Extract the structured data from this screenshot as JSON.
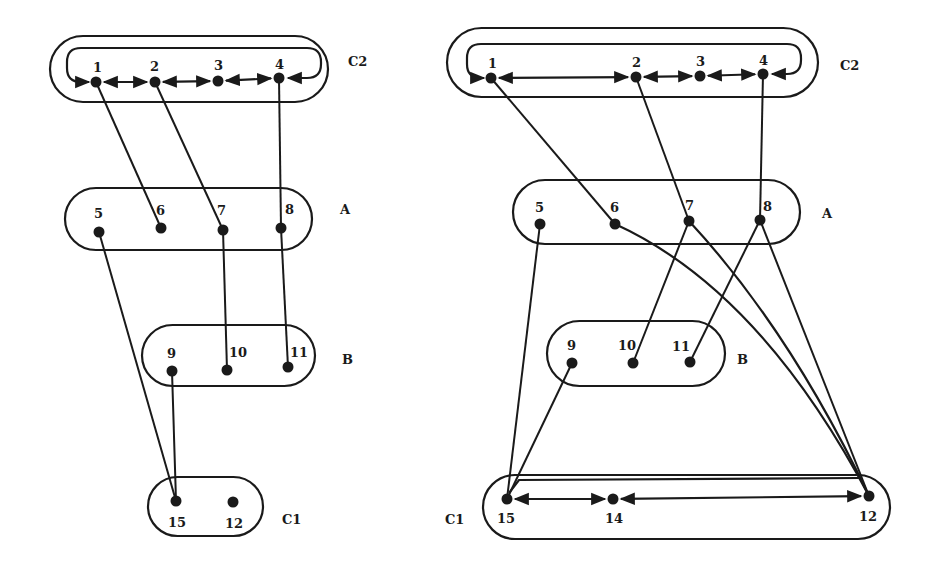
{
  "colors": {
    "ink": "#1a1a1a",
    "background": "#ffffff"
  },
  "diagrams": [
    {
      "name": "left",
      "groups": [
        {
          "id": "C2",
          "label": "C2",
          "box": [
            50,
            36,
            328,
            102
          ],
          "label_pos": [
            348,
            66
          ]
        },
        {
          "id": "A",
          "label": "A",
          "box": [
            65,
            188,
            312,
            250
          ],
          "label_pos": [
            340,
            214
          ]
        },
        {
          "id": "B",
          "label": "B",
          "box": [
            142,
            325,
            315,
            386
          ],
          "label_pos": [
            342,
            364
          ]
        },
        {
          "id": "C1",
          "label": "C1",
          "box": [
            148,
            477,
            263,
            536
          ],
          "label_pos": [
            282,
            524
          ]
        }
      ],
      "nodes": [
        {
          "id": "1",
          "label": "1",
          "x": 96,
          "y": 82,
          "label_dx": -3,
          "label_dy": -10
        },
        {
          "id": "2",
          "label": "2",
          "x": 155,
          "y": 82,
          "label_dx": -5,
          "label_dy": -11
        },
        {
          "id": "3",
          "label": "3",
          "x": 218,
          "y": 81,
          "label_dx": -4,
          "label_dy": -11
        },
        {
          "id": "4",
          "label": "4",
          "x": 279,
          "y": 78,
          "label_dx": -4,
          "label_dy": -9
        },
        {
          "id": "5",
          "label": "5",
          "x": 99,
          "y": 232,
          "label_dx": -5,
          "label_dy": -14
        },
        {
          "id": "6",
          "label": "6",
          "x": 161,
          "y": 228,
          "label_dx": -5,
          "label_dy": -13
        },
        {
          "id": "7",
          "label": "7",
          "x": 223,
          "y": 230,
          "label_dx": -6,
          "label_dy": -15
        },
        {
          "id": "8",
          "label": "8",
          "x": 281,
          "y": 228,
          "label_dx": 4,
          "label_dy": -14
        },
        {
          "id": "9",
          "label": "9",
          "x": 172,
          "y": 371,
          "label_dx": -5,
          "label_dy": -13
        },
        {
          "id": "10",
          "label": "10",
          "x": 227,
          "y": 370,
          "label_dx": 2,
          "label_dy": -13
        },
        {
          "id": "11",
          "label": "11",
          "x": 288,
          "y": 367,
          "label_dx": 2,
          "label_dy": -10
        },
        {
          "id": "15",
          "label": "15",
          "x": 176,
          "y": 501,
          "label_dx": -8,
          "label_dy": 26
        },
        {
          "id": "12",
          "label": "12",
          "x": 233,
          "y": 502,
          "label_dx": -8,
          "label_dy": 26
        }
      ],
      "edges": [
        {
          "from": "1",
          "to": "6"
        },
        {
          "from": "2",
          "to": "7"
        },
        {
          "from": "4",
          "to": "8"
        },
        {
          "from": "7",
          "to": "10"
        },
        {
          "from": "8",
          "to": "11"
        },
        {
          "from": "5",
          "to": "15"
        },
        {
          "from": "9",
          "to": "15"
        }
      ],
      "bidirectional": [
        {
          "from": "1",
          "to": "2"
        },
        {
          "from": "2",
          "to": "3"
        },
        {
          "from": "3",
          "to": "4"
        }
      ],
      "loop": {
        "from": "4",
        "to": "1",
        "top_y": 48,
        "left_x": 67,
        "right_x": 311
      }
    },
    {
      "name": "right",
      "groups": [
        {
          "id": "C2",
          "label": "C2",
          "box": [
            447,
            28,
            818,
            97
          ],
          "label_pos": [
            840,
            70
          ]
        },
        {
          "id": "A",
          "label": "A",
          "box": [
            513,
            180,
            800,
            244
          ],
          "label_pos": [
            822,
            218
          ]
        },
        {
          "id": "B",
          "label": "B",
          "box": [
            547,
            321,
            725,
            386
          ],
          "label_pos": [
            737,
            364
          ]
        },
        {
          "id": "C1",
          "label": "C1",
          "box": [
            483,
            475,
            890,
            539
          ],
          "label_pos": [
            445,
            524
          ]
        }
      ],
      "nodes": [
        {
          "id": "1",
          "label": "1",
          "x": 491,
          "y": 78,
          "label_dx": -3,
          "label_dy": -10
        },
        {
          "id": "2",
          "label": "2",
          "x": 636,
          "y": 77,
          "label_dx": -4,
          "label_dy": -10
        },
        {
          "id": "3",
          "label": "3",
          "x": 700,
          "y": 76,
          "label_dx": -4,
          "label_dy": -10
        },
        {
          "id": "4",
          "label": "4",
          "x": 763,
          "y": 74,
          "label_dx": -4,
          "label_dy": -9
        },
        {
          "id": "5",
          "label": "5",
          "x": 540,
          "y": 224,
          "label_dx": -5,
          "label_dy": -12
        },
        {
          "id": "6",
          "label": "6",
          "x": 615,
          "y": 224,
          "label_dx": -5,
          "label_dy": -12
        },
        {
          "id": "7",
          "label": "7",
          "x": 689,
          "y": 221,
          "label_dx": -4,
          "label_dy": -11
        },
        {
          "id": "8",
          "label": "8",
          "x": 760,
          "y": 220,
          "label_dx": 3,
          "label_dy": -9
        },
        {
          "id": "9",
          "label": "9",
          "x": 572,
          "y": 363,
          "label_dx": -5,
          "label_dy": -13
        },
        {
          "id": "10",
          "label": "10",
          "x": 633,
          "y": 363,
          "label_dx": -15,
          "label_dy": -13
        },
        {
          "id": "11",
          "label": "11",
          "x": 690,
          "y": 362,
          "label_dx": -18,
          "label_dy": -11
        },
        {
          "id": "15",
          "label": "15",
          "x": 507,
          "y": 499,
          "label_dx": -10,
          "label_dy": 24
        },
        {
          "id": "14",
          "label": "14",
          "x": 613,
          "y": 499,
          "label_dx": -8,
          "label_dy": 24
        },
        {
          "id": "12",
          "label": "12",
          "x": 869,
          "y": 496,
          "label_dx": -10,
          "label_dy": 25
        }
      ],
      "edges": [
        {
          "from": "1",
          "to": "6"
        },
        {
          "from": "2",
          "to": "7"
        },
        {
          "from": "4",
          "to": "8"
        },
        {
          "from": "7",
          "to": "10"
        },
        {
          "from": "8",
          "to": "11"
        },
        {
          "from": "5",
          "to": "15"
        },
        {
          "from": "9",
          "to": "15"
        },
        {
          "from": "8",
          "to": "12"
        },
        {
          "from": "7",
          "to": "12",
          "curve": [
            790,
            330
          ]
        },
        {
          "from": "6",
          "to": "12",
          "curve": [
            760,
            290
          ]
        }
      ],
      "bidirectional": [
        {
          "from": "1",
          "to": "2"
        },
        {
          "from": "2",
          "to": "3"
        },
        {
          "from": "3",
          "to": "4"
        },
        {
          "from": "15",
          "to": "14"
        },
        {
          "from": "14",
          "to": "12"
        }
      ],
      "loop": {
        "from": "4",
        "to": "1",
        "top_y": 44,
        "left_x": 467,
        "right_x": 791
      },
      "c1_top_link": {
        "from": "15",
        "to": "12",
        "y": 480
      }
    }
  ]
}
